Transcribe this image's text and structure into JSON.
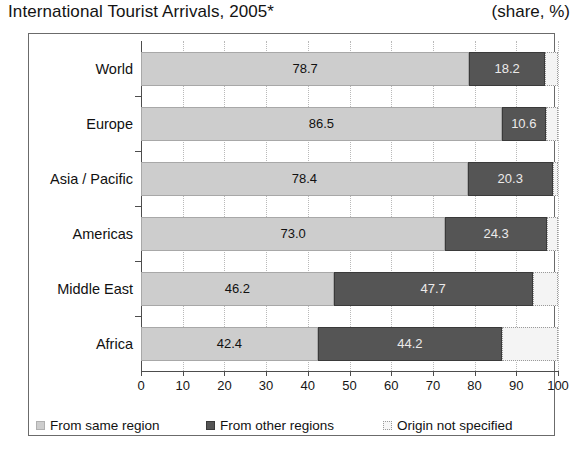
{
  "header": {
    "title": "International Tourist Arrivals, 2005*",
    "unit": "(share, %)"
  },
  "legend": {
    "items": [
      {
        "label": "From same region",
        "color": "#cdcdcd",
        "icon": "legend-swatch-icon"
      },
      {
        "label": "From other regions",
        "color": "#555555",
        "icon": "legend-swatch-icon"
      },
      {
        "label": "Origin not specified",
        "color": "#f4f4f4",
        "icon": "legend-swatch-icon"
      }
    ]
  },
  "axis": {
    "ticks": [
      "0",
      "10",
      "20",
      "30",
      "40",
      "50",
      "60",
      "70",
      "80",
      "90",
      "100"
    ]
  },
  "chart_data": {
    "type": "bar",
    "orientation": "horizontal",
    "stacked": true,
    "title": "International Tourist Arrivals, 2005*",
    "subtitle": "(share, %)",
    "xlabel": "",
    "ylabel": "",
    "xlim": [
      0,
      100
    ],
    "xticks": [
      0,
      10,
      20,
      30,
      40,
      50,
      60,
      70,
      80,
      90,
      100
    ],
    "grid": true,
    "legend_position": "bottom",
    "categories": [
      "World",
      "Europe",
      "Asia / Pacific",
      "Americas",
      "Middle East",
      "Africa"
    ],
    "series": [
      {
        "name": "From same region",
        "color": "#cdcdcd",
        "values": [
          78.7,
          86.5,
          78.4,
          73.0,
          46.2,
          42.4
        ],
        "labels": [
          "78.7",
          "86.5",
          "78.4",
          "73.0",
          "46.2",
          "42.4"
        ]
      },
      {
        "name": "From other regions",
        "color": "#555555",
        "values": [
          18.2,
          10.6,
          20.3,
          24.3,
          47.7,
          44.2
        ],
        "labels": [
          "18.2",
          "10.6",
          "20.3",
          "24.3",
          "47.7",
          "44.2"
        ]
      },
      {
        "name": "Origin not specified",
        "color": "#f4f4f4",
        "values": [
          3.1,
          2.9,
          1.3,
          2.7,
          6.1,
          13.4
        ],
        "labels": [
          "",
          "",
          "",
          "",
          "",
          ""
        ]
      }
    ]
  }
}
